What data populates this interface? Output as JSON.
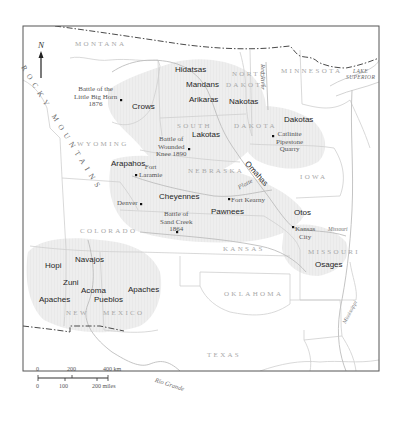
{
  "map": {
    "frame": {
      "x": 23,
      "y": 26,
      "width": 356,
      "height": 345
    },
    "colors": {
      "frame": "#555555",
      "state_border": "#cfcfcf",
      "national_border": "#4a4a4a",
      "territory_fill": "#ededed",
      "river": "#bdbdbd",
      "tribe_text": "#1e1e1e",
      "state_text": "#a8a8a8",
      "site_text": "#555555"
    },
    "north_arrow": {
      "label": "N"
    },
    "mountains": {
      "label": "ROCKY MOUNTAINS"
    },
    "states": [
      {
        "name": "MONTANA",
        "x": 75,
        "y": 45
      },
      {
        "name": "NORTH",
        "x": 232,
        "y": 75
      },
      {
        "name": "DAKOTA",
        "x": 226,
        "y": 85
      },
      {
        "name": "MINNESOTA",
        "x": 280,
        "y": 70
      },
      {
        "name": "SOUTH",
        "x": 177,
        "y": 126
      },
      {
        "name": "DAKOTA",
        "x": 234,
        "y": 126
      },
      {
        "name": "WYOMING",
        "x": 77,
        "y": 144
      },
      {
        "name": "NEBRASKA",
        "x": 187,
        "y": 171
      },
      {
        "name": "IOWA",
        "x": 300,
        "y": 176
      },
      {
        "name": "COLORADO",
        "x": 80,
        "y": 230
      },
      {
        "name": "KANSAS",
        "x": 223,
        "y": 248
      },
      {
        "name": "MISSOURI",
        "x": 308,
        "y": 251
      },
      {
        "name": "OKLAHOMA",
        "x": 224,
        "y": 293
      },
      {
        "name": "NEW",
        "x": 66,
        "y": 312
      },
      {
        "name": "MEXICO",
        "x": 103,
        "y": 312
      },
      {
        "name": "TEXAS",
        "x": 207,
        "y": 354
      }
    ],
    "tribes": [
      {
        "name": "Hidatsas",
        "x": 175,
        "y": 69
      },
      {
        "name": "Mandans",
        "x": 186,
        "y": 85
      },
      {
        "name": "Arikaras",
        "x": 189,
        "y": 100
      },
      {
        "name": "Nakotas",
        "x": 229,
        "y": 101
      },
      {
        "name": "Crows",
        "x": 132,
        "y": 106
      },
      {
        "name": "Dakotas",
        "x": 284,
        "y": 119
      },
      {
        "name": "Lakotas",
        "x": 192,
        "y": 134
      },
      {
        "name": "Arapahos",
        "x": 111,
        "y": 160
      },
      {
        "name": "Cheyennes",
        "x": 159,
        "y": 193
      },
      {
        "name": "Pawnees",
        "x": 211,
        "y": 208
      },
      {
        "name": "Otos",
        "x": 294,
        "y": 209
      },
      {
        "name": "Osages",
        "x": 315,
        "y": 261
      },
      {
        "name": "Hopi",
        "x": 45,
        "y": 262
      },
      {
        "name": "Navajos",
        "x": 75,
        "y": 256
      },
      {
        "name": "Zuni",
        "x": 63,
        "y": 279
      },
      {
        "name": "Acoma",
        "x": 81,
        "y": 287
      },
      {
        "name": "Apaches",
        "x": 128,
        "y": 286
      },
      {
        "name": "Apaches",
        "x": 39,
        "y": 296
      },
      {
        "name": "Pueblos",
        "x": 94,
        "y": 296
      }
    ],
    "sites": [
      {
        "name": "Battle of the Little Big Horn 1876",
        "lines": [
          "Battle of the",
          "Little Big Horn",
          "1876"
        ],
        "x": 76,
        "y": 88,
        "dot": [
          121,
          100
        ]
      },
      {
        "name": "Battle of Wounded Knee 1890",
        "lines": [
          "Battle of",
          "Wounded",
          "Knee 1890"
        ],
        "x": 156,
        "y": 138,
        "dot": [
          189,
          149
        ]
      },
      {
        "name": "Catlinite Pipestone Quarry",
        "lines": [
          "Catlinite",
          "Pipestone",
          "Quarry"
        ],
        "x": 277,
        "y": 133,
        "dot": [
          273,
          136
        ]
      },
      {
        "name": "Fort Laramie",
        "lines": [
          "Fort",
          "Laramie"
        ],
        "x": 138,
        "y": 165,
        "dot": [
          136,
          175
        ]
      },
      {
        "name": "Denver",
        "lines": [
          "Denver"
        ],
        "x": 118,
        "y": 201,
        "dot": [
          141,
          204
        ]
      },
      {
        "name": "Battle of Sand Creek 1864",
        "lines": [
          "Battle of",
          "Sand Creek",
          "1864"
        ],
        "x": 161,
        "y": 212,
        "dot": [
          177,
          232
        ]
      },
      {
        "name": "Fort Kearny",
        "lines": [
          "Fort Kearny"
        ],
        "x": 231,
        "y": 198,
        "dot": [
          229,
          199
        ]
      },
      {
        "name": "Kansas City",
        "lines": [
          "Kansas",
          "City"
        ],
        "x": 295,
        "y": 226,
        "dot": [
          293,
          227
        ]
      }
    ],
    "rivers": [
      {
        "name": "Red River",
        "x": 270,
        "y": 80,
        "rotate": 90
      },
      {
        "name": "Omahas",
        "x": 248,
        "y": 170,
        "rotate": 48,
        "is_tribe": true
      },
      {
        "name": "Platte",
        "x": 236,
        "y": 180,
        "rotate": -28
      },
      {
        "name": "Missouri",
        "x": 327,
        "y": 228,
        "rotate": 0
      },
      {
        "name": "Mississippi",
        "x": 339,
        "y": 300,
        "rotate": -62
      },
      {
        "name": "Rio Grande",
        "x": 157,
        "y": 383,
        "rotate": 18
      }
    ],
    "lake": {
      "lines": [
        "LAKE",
        "SUPERIOR"
      ],
      "x": 351,
      "y": 71
    },
    "scale_bar": {
      "km_labels": [
        "0",
        "200",
        "400 km"
      ],
      "mile_labels": [
        "0",
        "100",
        "200 miles"
      ]
    }
  }
}
